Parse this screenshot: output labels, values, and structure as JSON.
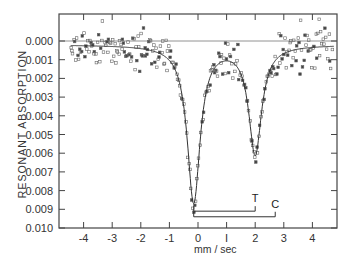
{
  "chart_data": {
    "type": "scatter",
    "title": "",
    "xlabel": "mm / sec",
    "ylabel": "RESONANT ABSORPTION",
    "xlim": [
      -4.5,
      4.8
    ],
    "ylim": [
      0.01,
      -0.0014
    ],
    "y_inverted": true,
    "grid": false,
    "legend": null,
    "x_ticks": [
      -4,
      -3,
      -2,
      -1,
      0,
      1,
      2,
      3,
      4
    ],
    "x_tick_labels": [
      "-4",
      "-3",
      "-2",
      "-1",
      "0",
      "I",
      "2",
      "3",
      "4"
    ],
    "y_ticks": [
      0.0,
      0.001,
      0.002,
      0.003,
      0.004,
      0.005,
      0.006,
      0.007,
      0.008,
      0.009,
      0.01
    ],
    "y_tick_labels": [
      "0.000",
      "0.001",
      "0.002",
      "0.003",
      "0.004",
      "0.005",
      "0.006",
      "0.007",
      "0.008",
      "0.009",
      "0.010"
    ],
    "reference_line": {
      "y": 0.0
    },
    "fit_curve": {
      "description": "Two Lorentzian absorption lines (Mossbauer spectrum)",
      "baseline": 0.0002,
      "lines": [
        {
          "center": -0.15,
          "depth": 0.0086,
          "fwhm": 0.55
        },
        {
          "center": 2.0,
          "depth": 0.006,
          "fwhm": 0.55
        }
      ],
      "x": [
        -4.5,
        -4,
        -3,
        -2,
        -1.5,
        -1,
        -0.75,
        -0.5,
        -0.35,
        -0.15,
        0.05,
        0.2,
        0.4,
        0.6,
        0.8,
        1.0,
        1.2,
        1.4,
        1.6,
        1.8,
        2.0,
        2.2,
        2.4,
        2.6,
        2.8,
        3.0,
        3.5,
        4,
        4.7
      ],
      "y": [
        0.0002,
        0.0002,
        0.0003,
        0.0003,
        0.0005,
        0.0012,
        0.0021,
        0.004,
        0.0062,
        0.0088,
        0.0062,
        0.004,
        0.0021,
        0.0013,
        0.001,
        0.001,
        0.0013,
        0.0021,
        0.0035,
        0.0052,
        0.0062,
        0.0052,
        0.0035,
        0.002,
        0.0011,
        0.0007,
        0.0004,
        0.0003,
        0.0003
      ]
    },
    "scatter_note": "Dense noisy data points (~±0.0008 spread) surrounding fit curve",
    "annotations": [
      {
        "label": "T",
        "bracket_from": -0.15,
        "bracket_to": 2.0,
        "y": 0.0091
      },
      {
        "label": "C",
        "bracket_from": -0.15,
        "bracket_to": 2.7,
        "y": 0.0094
      }
    ]
  },
  "labels": {
    "xlabel": "mm / sec",
    "ylabel": "RESONANT ABSORPTION",
    "T": "T",
    "C": "C"
  }
}
